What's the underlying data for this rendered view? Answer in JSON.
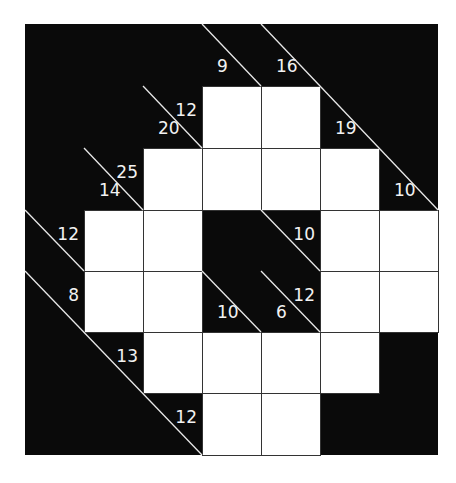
{
  "puzzle": {
    "type": "kakuro",
    "rows": 7,
    "cols": 7,
    "colors": {
      "black": "#0a0a0a",
      "white": "#ffffff",
      "clue_text": "#f2f2f2",
      "grid_line": "#333333"
    },
    "grid": [
      [
        "B",
        "B",
        "B",
        "B",
        "B",
        "B",
        "B"
      ],
      [
        "B",
        "B",
        "B",
        "W",
        "W",
        "B",
        "B"
      ],
      [
        "B",
        "B",
        "W",
        "W",
        "W",
        "W",
        "B"
      ],
      [
        "B",
        "W",
        "W",
        "B",
        "B",
        "W",
        "W"
      ],
      [
        "B",
        "W",
        "W",
        "B",
        "B",
        "W",
        "W"
      ],
      [
        "B",
        "B",
        "W",
        "W",
        "W",
        "W",
        "B"
      ],
      [
        "B",
        "B",
        "B",
        "W",
        "W",
        "B",
        "B"
      ]
    ],
    "clues": [
      {
        "row": 0,
        "col": 3,
        "down": "9"
      },
      {
        "row": 0,
        "col": 4,
        "down": "16"
      },
      {
        "row": 1,
        "col": 2,
        "across": "12",
        "down": "20"
      },
      {
        "row": 1,
        "col": 5,
        "down": "19"
      },
      {
        "row": 2,
        "col": 1,
        "across": "25",
        "down": "14"
      },
      {
        "row": 2,
        "col": 6,
        "down": "10"
      },
      {
        "row": 3,
        "col": 0,
        "across": "12"
      },
      {
        "row": 3,
        "col": 4,
        "across": "10"
      },
      {
        "row": 4,
        "col": 0,
        "across": "8"
      },
      {
        "row": 4,
        "col": 3,
        "down": "10"
      },
      {
        "row": 4,
        "col": 4,
        "across": "12",
        "down": "6"
      },
      {
        "row": 5,
        "col": 1,
        "across": "13"
      },
      {
        "row": 6,
        "col": 2,
        "across": "12"
      }
    ]
  }
}
